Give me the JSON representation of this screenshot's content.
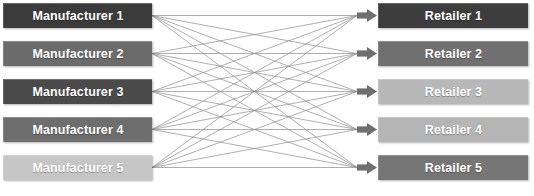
{
  "diagram": {
    "type": "bipartite-network",
    "width": 534,
    "height": 196,
    "background": "#ffffff",
    "edge_color": "#8c8c8c",
    "edge_width": 0.7,
    "edge_count": 25,
    "arrow_color": "#6f6f6f",
    "label_color": "#ffffff",
    "left_column": {
      "title": "Manufacturers",
      "nodes": [
        {
          "label": "Manufacturer 1",
          "fill": "#3b3b3b",
          "x": 3,
          "y": 3,
          "width": 149,
          "height": 25
        },
        {
          "label": "Manufacturer 2",
          "fill": "#6b6b6b",
          "x": 3,
          "y": 41,
          "width": 149,
          "height": 25
        },
        {
          "label": "Manufacturer 3",
          "fill": "#4a4a4a",
          "x": 3,
          "y": 79,
          "width": 149,
          "height": 25
        },
        {
          "label": "Manufacturer 4",
          "fill": "#6e6e6e",
          "x": 3,
          "y": 117,
          "width": 149,
          "height": 25
        },
        {
          "label": "Manufacturer 5",
          "fill": "#c6c6c6",
          "x": 3,
          "y": 155,
          "width": 149,
          "height": 25
        }
      ]
    },
    "right_column": {
      "title": "Retailers",
      "nodes": [
        {
          "label": "Retailer 1",
          "fill": "#3d3d3d",
          "x": 378,
          "y": 3,
          "width": 150,
          "height": 25
        },
        {
          "label": "Retailer 2",
          "fill": "#707070",
          "x": 378,
          "y": 41,
          "width": 150,
          "height": 25
        },
        {
          "label": "Retailer 3",
          "fill": "#b8b8b8",
          "x": 378,
          "y": 79,
          "width": 150,
          "height": 25
        },
        {
          "label": "Retailer 4",
          "fill": "#b5b5b5",
          "x": 378,
          "y": 117,
          "width": 150,
          "height": 25
        },
        {
          "label": "Retailer 5",
          "fill": "#767676",
          "x": 378,
          "y": 155,
          "width": 150,
          "height": 25
        }
      ]
    },
    "edges": [
      {
        "from": 0,
        "to": 0
      },
      {
        "from": 0,
        "to": 1
      },
      {
        "from": 0,
        "to": 2
      },
      {
        "from": 0,
        "to": 3
      },
      {
        "from": 0,
        "to": 4
      },
      {
        "from": 1,
        "to": 0
      },
      {
        "from": 1,
        "to": 1
      },
      {
        "from": 1,
        "to": 2
      },
      {
        "from": 1,
        "to": 3
      },
      {
        "from": 1,
        "to": 4
      },
      {
        "from": 2,
        "to": 0
      },
      {
        "from": 2,
        "to": 1
      },
      {
        "from": 2,
        "to": 2
      },
      {
        "from": 2,
        "to": 3
      },
      {
        "from": 2,
        "to": 4
      },
      {
        "from": 3,
        "to": 0
      },
      {
        "from": 3,
        "to": 1
      },
      {
        "from": 3,
        "to": 2
      },
      {
        "from": 3,
        "to": 3
      },
      {
        "from": 3,
        "to": 4
      },
      {
        "from": 4,
        "to": 0
      },
      {
        "from": 4,
        "to": 1
      },
      {
        "from": 4,
        "to": 2
      },
      {
        "from": 4,
        "to": 3
      },
      {
        "from": 4,
        "to": 4
      }
    ]
  }
}
